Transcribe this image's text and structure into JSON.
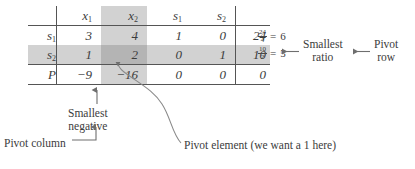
{
  "diagram": {
    "type": "annotated-table"
  },
  "tableau": {
    "corner": "",
    "column_headers": [
      "x₁",
      "x₂",
      "s₁",
      "s₂",
      ""
    ],
    "column_headers_parts": [
      {
        "base": "x",
        "sub": "1"
      },
      {
        "base": "x",
        "sub": "2"
      },
      {
        "base": "s",
        "sub": "1"
      },
      {
        "base": "s",
        "sub": "2"
      },
      {
        "base": "",
        "sub": ""
      }
    ],
    "rows": [
      {
        "label_base": "s",
        "label_sub": "1",
        "label": "s₁",
        "cells": [
          "3",
          "4",
          "1",
          "0",
          "24"
        ]
      },
      {
        "label_base": "s",
        "label_sub": "2",
        "label": "s₂",
        "cells": [
          "1",
          "2",
          "0",
          "1",
          "10"
        ]
      },
      {
        "label_base": "P",
        "label_sub": "",
        "label": "P",
        "cells": [
          "−9",
          "−16",
          "0",
          "0",
          "0"
        ]
      }
    ],
    "highlight": {
      "pivot_column_index": 1,
      "pivot_row_index": 1,
      "pivot_value": "2",
      "smallest_negative_value": "−16",
      "column_shade_color": "#d2d2d2",
      "row_shade_color": "#d2d2d2",
      "pivot_cell_color": "#b4b4b4"
    }
  },
  "ratios": {
    "items": [
      {
        "numerator": "24",
        "denominator": "4",
        "equals": "=",
        "value": "6"
      },
      {
        "numerator": "10",
        "denominator": "2",
        "equals": "=",
        "value": "5"
      }
    ]
  },
  "annotations": {
    "smallest_ratio": {
      "line1": "Smallest",
      "line2": "ratio"
    },
    "pivot_row": {
      "line1": "Pivot",
      "line2": "row"
    },
    "smallest_negative": {
      "line1": "Smallest",
      "line2": "negative"
    },
    "pivot_column": {
      "text": "Pivot column"
    },
    "pivot_element": {
      "text": "Pivot element (we want a 1 here)"
    }
  },
  "colors": {
    "ink": "#3c3c3c",
    "rule": "#555555",
    "leader": "#8a8a8a",
    "shade_light": "#d2d2d2",
    "shade_dark": "#b4b4b4"
  }
}
